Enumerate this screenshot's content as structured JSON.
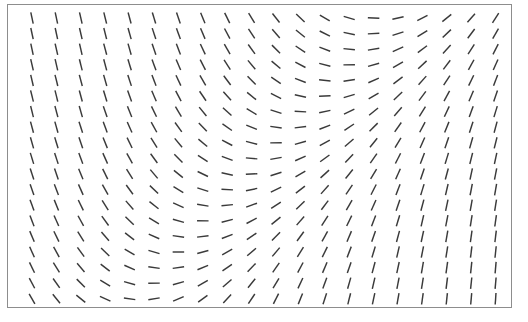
{
  "figure": {
    "title": "",
    "background_color": "#ffffff",
    "panel": {
      "x": 7,
      "y": 4,
      "width": 505,
      "height": 304,
      "border_color": "#8d8d8d",
      "border_width": 1,
      "fill_color": "#ffffff"
    }
  },
  "chart_data": {
    "type": "scatter",
    "plot_kind": "direction-field",
    "title": "",
    "subtitle": "",
    "xlabel": "",
    "ylabel": "",
    "xlim": [
      0,
      20
    ],
    "ylim": [
      0,
      19
    ],
    "grid": false,
    "legend": null,
    "tick_labels": {
      "x": [],
      "y": []
    },
    "annotations": [],
    "marker": {
      "style": "line-segment",
      "length_px": 11.5,
      "color": "#3a3a3a",
      "width_px": 1.45
    },
    "grid_layout": {
      "columns": 20,
      "rows": 19,
      "x_start_px": 31,
      "y_start_px": 17,
      "x_spacing_px": 24.4,
      "y_spacing_px": 15.6
    },
    "angle_description": "Segment inclination rotates smoothly across the panel: steeply left-leaning (negative slope) in the upper-left region, passing through horizontal along a band that runs diagonally from upper-right down to lower-left, then becoming right-leaning (positive slope) and approaching vertical toward the right edge and the lower portion of the panel.",
    "angles_deg": [
      [
        -78,
        -78,
        -77,
        -76,
        -75,
        -73,
        -71,
        -68,
        -64,
        -59,
        -52,
        -43,
        -31,
        -17,
        -2,
        13,
        27,
        39,
        49,
        57
      ],
      [
        -78,
        -78,
        -77,
        -76,
        -74,
        -72,
        -70,
        -67,
        -62,
        -57,
        -49,
        -39,
        -27,
        -12,
        3,
        18,
        32,
        44,
        53,
        60
      ],
      [
        -78,
        -77,
        -77,
        -75,
        -74,
        -71,
        -69,
        -65,
        -60,
        -54,
        -45,
        -34,
        -21,
        -6,
        9,
        24,
        37,
        48,
        57,
        63
      ],
      [
        -77,
        -77,
        -76,
        -75,
        -73,
        -70,
        -67,
        -63,
        -57,
        -50,
        -40,
        -28,
        -14,
        1,
        16,
        30,
        43,
        53,
        61,
        66
      ],
      [
        -77,
        -76,
        -75,
        -74,
        -72,
        -69,
        -65,
        -60,
        -53,
        -45,
        -34,
        -21,
        -6,
        9,
        24,
        37,
        48,
        57,
        64,
        69
      ],
      [
        -76,
        -76,
        -75,
        -73,
        -70,
        -67,
        -62,
        -56,
        -48,
        -39,
        -27,
        -13,
        2,
        17,
        31,
        43,
        53,
        61,
        67,
        71
      ],
      [
        -76,
        -75,
        -74,
        -71,
        -68,
        -64,
        -59,
        -51,
        -42,
        -31,
        -18,
        -3,
        12,
        26,
        39,
        49,
        58,
        65,
        70,
        73
      ],
      [
        -75,
        -74,
        -72,
        -70,
        -66,
        -61,
        -54,
        -46,
        -35,
        -22,
        -8,
        7,
        21,
        34,
        45,
        55,
        62,
        68,
        72,
        75
      ],
      [
        -74,
        -73,
        -71,
        -68,
        -64,
        -58,
        -50,
        -40,
        -28,
        -14,
        1,
        16,
        29,
        41,
        51,
        59,
        66,
        71,
        74,
        76
      ],
      [
        -73,
        -72,
        -70,
        -66,
        -61,
        -54,
        -45,
        -33,
        -20,
        -5,
        10,
        24,
        36,
        47,
        55,
        63,
        69,
        73,
        76,
        78
      ],
      [
        -72,
        -71,
        -68,
        -64,
        -58,
        -50,
        -39,
        -26,
        -12,
        3,
        18,
        31,
        42,
        51,
        59,
        66,
        71,
        75,
        78,
        79
      ],
      [
        -71,
        -69,
        -66,
        -61,
        -54,
        -44,
        -32,
        -18,
        -3,
        12,
        26,
        38,
        48,
        56,
        63,
        69,
        73,
        77,
        79,
        80
      ],
      [
        -70,
        -68,
        -64,
        -58,
        -49,
        -38,
        -24,
        -9,
        6,
        20,
        33,
        44,
        53,
        60,
        66,
        71,
        75,
        78,
        80,
        81
      ],
      [
        -69,
        -66,
        -61,
        -54,
        -44,
        -31,
        -16,
        -1,
        14,
        28,
        39,
        49,
        57,
        64,
        69,
        73,
        77,
        79,
        81,
        82
      ],
      [
        -67,
        -64,
        -58,
        -49,
        -38,
        -24,
        -8,
        7,
        21,
        34,
        45,
        54,
        61,
        67,
        71,
        75,
        78,
        80,
        82,
        83
      ],
      [
        -66,
        -61,
        -54,
        -44,
        -31,
        -16,
        0,
        15,
        29,
        40,
        50,
        58,
        64,
        69,
        73,
        77,
        79,
        81,
        83,
        84
      ],
      [
        -64,
        -58,
        -50,
        -38,
        -24,
        -8,
        8,
        22,
        35,
        46,
        55,
        62,
        67,
        71,
        75,
        78,
        80,
        82,
        84,
        85
      ],
      [
        -62,
        -55,
        -45,
        -31,
        -16,
        1,
        16,
        30,
        41,
        51,
        59,
        65,
        70,
        74,
        77,
        79,
        81,
        83,
        84,
        85
      ],
      [
        -60,
        -51,
        -39,
        -24,
        -8,
        9,
        23,
        36,
        47,
        56,
        63,
        68,
        72,
        76,
        78,
        80,
        82,
        84,
        85,
        86
      ]
    ]
  }
}
